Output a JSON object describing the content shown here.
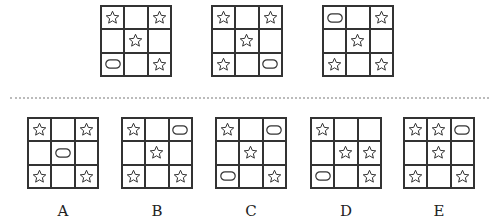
{
  "puzzle": {
    "question_row": [
      {
        "id": "Q1",
        "cells": [
          "star",
          "empty",
          "star",
          "empty",
          "star",
          "empty",
          "pill",
          "empty",
          "star"
        ]
      },
      {
        "id": "Q2",
        "cells": [
          "star",
          "empty",
          "star",
          "empty",
          "star",
          "empty",
          "star",
          "empty",
          "pill"
        ]
      },
      {
        "id": "Q3",
        "cells": [
          "pill",
          "empty",
          "star",
          "empty",
          "star",
          "empty",
          "star",
          "empty",
          "star"
        ]
      }
    ],
    "options": [
      {
        "label": "A",
        "cells": [
          "star",
          "empty",
          "star",
          "empty",
          "pill",
          "empty",
          "star",
          "empty",
          "star"
        ]
      },
      {
        "label": "B",
        "cells": [
          "star",
          "empty",
          "pill",
          "empty",
          "star",
          "empty",
          "star",
          "empty",
          "star"
        ]
      },
      {
        "label": "C",
        "cells": [
          "star",
          "empty",
          "pill",
          "empty",
          "star",
          "empty",
          "pill",
          "empty",
          "star"
        ]
      },
      {
        "label": "D",
        "cells": [
          "star",
          "empty",
          "empty",
          "empty",
          "star",
          "star",
          "pill",
          "empty",
          "star"
        ]
      },
      {
        "label": "E",
        "cells": [
          "star",
          "star",
          "pill",
          "empty",
          "star",
          "empty",
          "star",
          "empty",
          "star"
        ]
      }
    ],
    "colors": {
      "line": "#333333",
      "divider": "#bbbbbb"
    }
  }
}
